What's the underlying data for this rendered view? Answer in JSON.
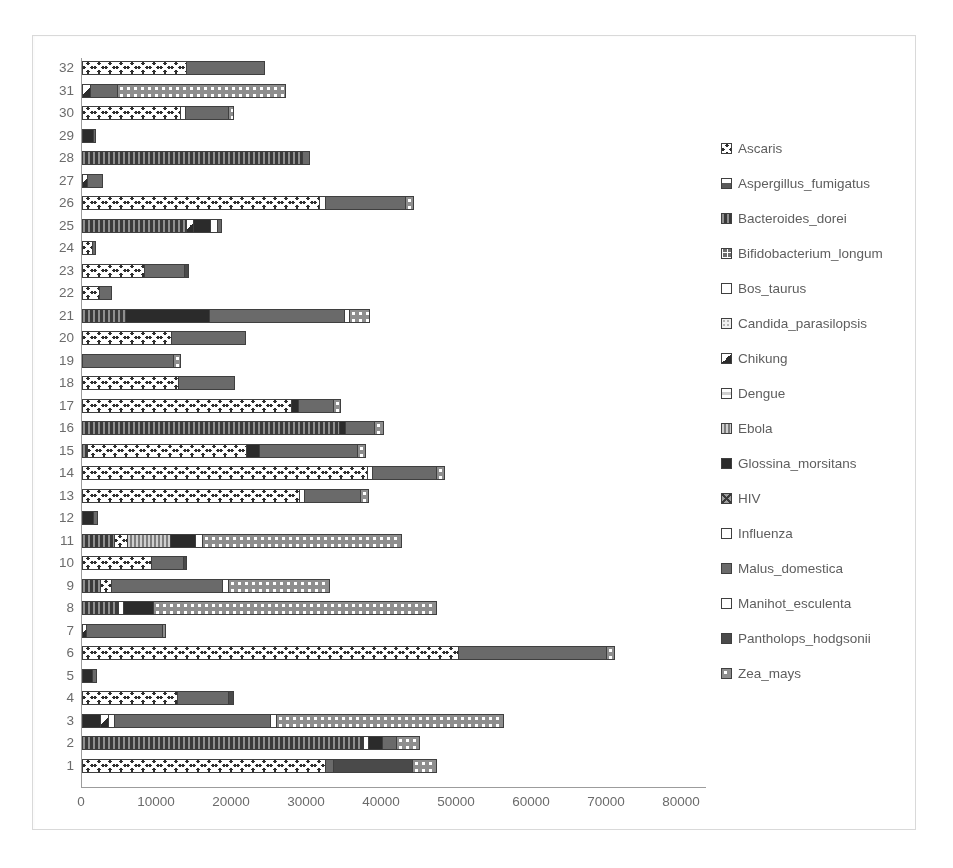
{
  "chart_data": {
    "type": "bar",
    "subtype": "stacked-horizontal-bar",
    "title": "",
    "xlabel": "",
    "ylabel": "",
    "xlim": [
      0,
      80000
    ],
    "ylim": [
      1,
      32
    ],
    "grid": false,
    "legend_position": "right",
    "x_ticks": [
      "0",
      "10000",
      "20000",
      "30000",
      "40000",
      "50000",
      "60000",
      "70000",
      "80000"
    ],
    "x_tick_values": [
      0,
      10000,
      20000,
      30000,
      40000,
      50000,
      60000,
      70000,
      80000
    ],
    "categories": [
      "1",
      "2",
      "3",
      "4",
      "5",
      "6",
      "7",
      "8",
      "9",
      "10",
      "11",
      "12",
      "13",
      "14",
      "15",
      "16",
      "17",
      "18",
      "19",
      "20",
      "21",
      "22",
      "23",
      "24",
      "25",
      "26",
      "27",
      "28",
      "29",
      "30",
      "31",
      "32"
    ],
    "series": [
      {
        "name": "Ascaris",
        "pattern": "dark-dense-grid",
        "color": "#4a4a4a"
      },
      {
        "name": "Aspergillus_fumigatus",
        "pattern": "split-box",
        "color": "#737373"
      },
      {
        "name": "Bacteroides_dorei",
        "pattern": "vertical-lines",
        "color": "#595959"
      },
      {
        "name": "Bifidobacterium_longum",
        "pattern": "cross-grid",
        "color": "#6e6e6e"
      },
      {
        "name": "Bos_taurus",
        "pattern": "solid-white",
        "color": "#ffffff"
      },
      {
        "name": "Candida_parasilopsis",
        "pattern": "light-dots",
        "color": "#f2f2f2"
      },
      {
        "name": "Chikung",
        "pattern": "half-filled",
        "color": "#404040"
      },
      {
        "name": "Dengue",
        "pattern": "small-square",
        "color": "#ffffff"
      },
      {
        "name": "Ebola",
        "pattern": "mid-gray-box",
        "color": "#8c8c8c"
      },
      {
        "name": "Glossina_morsitans",
        "pattern": "solid-dark",
        "color": "#333333"
      },
      {
        "name": "HIV",
        "pattern": "diagonal-cross",
        "color": "#9e9e9e"
      },
      {
        "name": "Influenza",
        "pattern": "empty-white",
        "color": "#ffffff"
      },
      {
        "name": "Malus_domestica",
        "pattern": "solid-gray",
        "color": "#5b5b5b"
      },
      {
        "name": "Manihot_esculenta",
        "pattern": "empty-white-2",
        "color": "#ffffff"
      },
      {
        "name": "Pantholops_hodgsonii",
        "pattern": "small-solid",
        "color": "#4f4f4f"
      },
      {
        "name": "Zea_mays",
        "pattern": "dotted-circles",
        "color": "#9a9a9a"
      }
    ],
    "stacks": [
      {
        "category": "1",
        "total": 47300,
        "segments": [
          {
            "series": "Ascaris",
            "value": 32400
          },
          {
            "series": "Malus_domestica",
            "value": 1100
          },
          {
            "series": "Pantholops_hodgsonii",
            "value": 10500
          },
          {
            "series": "Zea_mays",
            "value": 3300
          }
        ]
      },
      {
        "category": "2",
        "total": 45000,
        "segments": [
          {
            "series": "Bacteroides_dorei",
            "value": 37400
          },
          {
            "series": "Influenza",
            "value": 700
          },
          {
            "series": "Glossina_morsitans",
            "value": 1900
          },
          {
            "series": "Malus_domestica",
            "value": 1900
          },
          {
            "series": "Zea_mays",
            "value": 3100
          }
        ]
      },
      {
        "category": "3",
        "total": 56300,
        "segments": [
          {
            "series": "Glossina_morsitans",
            "value": 2400
          },
          {
            "series": "Chikung",
            "value": 1100
          },
          {
            "series": "Bos_taurus",
            "value": 700
          },
          {
            "series": "Malus_domestica",
            "value": 20900
          },
          {
            "series": "Influenza",
            "value": 800
          },
          {
            "series": "Zea_mays",
            "value": 30400
          }
        ]
      },
      {
        "category": "4",
        "total": 20200,
        "segments": [
          {
            "series": "Ascaris",
            "value": 12700
          },
          {
            "series": "Malus_domestica",
            "value": 6800
          },
          {
            "series": "Pantholops_hodgsonii",
            "value": 700
          }
        ]
      },
      {
        "category": "5",
        "total": 2000,
        "segments": [
          {
            "series": "Glossina_morsitans",
            "value": 1300
          },
          {
            "series": "Malus_domestica",
            "value": 700
          }
        ]
      },
      {
        "category": "6",
        "total": 71000,
        "segments": [
          {
            "series": "Ascaris",
            "value": 50100
          },
          {
            "series": "Malus_domestica",
            "value": 19700
          },
          {
            "series": "Zea_mays",
            "value": 1200
          }
        ]
      },
      {
        "category": "7",
        "total": 11200,
        "segments": [
          {
            "series": "Chikung",
            "value": 500
          },
          {
            "series": "Malus_domestica",
            "value": 10100
          },
          {
            "series": "Zea_mays",
            "value": 600
          }
        ]
      },
      {
        "category": "8",
        "total": 47300,
        "segments": [
          {
            "series": "Bacteroides_dorei",
            "value": 4800
          },
          {
            "series": "Bos_taurus",
            "value": 700
          },
          {
            "series": "Glossina_morsitans",
            "value": 3900
          },
          {
            "series": "Zea_mays",
            "value": 37900
          }
        ]
      },
      {
        "category": "9",
        "total": 33000,
        "segments": [
          {
            "series": "Bacteroides_dorei",
            "value": 2400
          },
          {
            "series": "Ascaris",
            "value": 1500
          },
          {
            "series": "Malus_domestica",
            "value": 14700
          },
          {
            "series": "Influenza",
            "value": 800
          },
          {
            "series": "Zea_mays",
            "value": 13600
          }
        ]
      },
      {
        "category": "10",
        "total": 14000,
        "segments": [
          {
            "series": "Ascaris",
            "value": 9200
          },
          {
            "series": "Malus_domestica",
            "value": 4300
          },
          {
            "series": "Pantholops_hodgsonii",
            "value": 500
          }
        ]
      },
      {
        "category": "11",
        "total": 42700,
        "segments": [
          {
            "series": "Bacteroides_dorei",
            "value": 4300
          },
          {
            "series": "Ascaris",
            "value": 1700
          },
          {
            "series": "Ebola",
            "value": 5700
          },
          {
            "series": "Glossina_morsitans",
            "value": 3400
          },
          {
            "series": "Influenza",
            "value": 900
          },
          {
            "series": "Zea_mays",
            "value": 26700
          }
        ]
      },
      {
        "category": "12",
        "total": 2100,
        "segments": [
          {
            "series": "Glossina_morsitans",
            "value": 1400
          },
          {
            "series": "Malus_domestica",
            "value": 700
          }
        ]
      },
      {
        "category": "13",
        "total": 38300,
        "segments": [
          {
            "series": "Ascaris",
            "value": 28900
          },
          {
            "series": "Influenza",
            "value": 700
          },
          {
            "series": "Malus_domestica",
            "value": 7500
          },
          {
            "series": "Zea_mays",
            "value": 1200
          }
        ]
      },
      {
        "category": "14",
        "total": 48400,
        "segments": [
          {
            "series": "Ascaris",
            "value": 38000
          },
          {
            "series": "Influenza",
            "value": 700
          },
          {
            "series": "Malus_domestica",
            "value": 8500
          },
          {
            "series": "Zea_mays",
            "value": 1200
          }
        ]
      },
      {
        "category": "15",
        "total": 37900,
        "segments": [
          {
            "series": "Bacteroides_dorei",
            "value": 700
          },
          {
            "series": "Ascaris",
            "value": 21200
          },
          {
            "series": "Glossina_morsitans",
            "value": 1700
          },
          {
            "series": "Malus_domestica",
            "value": 13100
          },
          {
            "series": "Zea_mays",
            "value": 1200
          }
        ]
      },
      {
        "category": "16",
        "total": 40300,
        "segments": [
          {
            "series": "Bacteroides_dorei",
            "value": 34200
          },
          {
            "series": "Glossina_morsitans",
            "value": 900
          },
          {
            "series": "Malus_domestica",
            "value": 3800
          },
          {
            "series": "Zea_mays",
            "value": 1400
          }
        ]
      },
      {
        "category": "17",
        "total": 34500,
        "segments": [
          {
            "series": "Ascaris",
            "value": 27900
          },
          {
            "series": "Glossina_morsitans",
            "value": 900
          },
          {
            "series": "Malus_domestica",
            "value": 4700
          },
          {
            "series": "Zea_mays",
            "value": 1000
          }
        ]
      },
      {
        "category": "18",
        "total": 20400,
        "segments": [
          {
            "series": "Ascaris",
            "value": 12800
          },
          {
            "series": "Malus_domestica",
            "value": 7600
          }
        ]
      },
      {
        "category": "19",
        "total": 13200,
        "segments": [
          {
            "series": "Malus_domestica",
            "value": 12100
          },
          {
            "series": "Zea_mays",
            "value": 1100
          }
        ]
      },
      {
        "category": "20",
        "total": 21800,
        "segments": [
          {
            "series": "Ascaris",
            "value": 11900
          },
          {
            "series": "Malus_domestica",
            "value": 9900
          }
        ]
      },
      {
        "category": "21",
        "total": 38400,
        "segments": [
          {
            "series": "Bacteroides_dorei",
            "value": 5700
          },
          {
            "series": "Glossina_morsitans",
            "value": 11200
          },
          {
            "series": "Malus_domestica",
            "value": 18000
          },
          {
            "series": "Influenza",
            "value": 700
          },
          {
            "series": "Zea_mays",
            "value": 2800
          }
        ]
      },
      {
        "category": "22",
        "total": 4000,
        "segments": [
          {
            "series": "Ascaris",
            "value": 2200
          },
          {
            "series": "Malus_domestica",
            "value": 1800
          }
        ]
      },
      {
        "category": "23",
        "total": 14300,
        "segments": [
          {
            "series": "Ascaris",
            "value": 8200
          },
          {
            "series": "Malus_domestica",
            "value": 5400
          },
          {
            "series": "Pantholops_hodgsonii",
            "value": 700
          }
        ]
      },
      {
        "category": "24",
        "total": 1800,
        "segments": [
          {
            "series": "Ascaris",
            "value": 1300
          },
          {
            "series": "Malus_domestica",
            "value": 500
          }
        ]
      },
      {
        "category": "25",
        "total": 18700,
        "segments": [
          {
            "series": "Bacteroides_dorei",
            "value": 13900
          },
          {
            "series": "Chikung",
            "value": 900
          },
          {
            "series": "Glossina_morsitans",
            "value": 2300
          },
          {
            "series": "Influenza",
            "value": 900
          },
          {
            "series": "Malus_domestica",
            "value": 700
          }
        ]
      },
      {
        "category": "26",
        "total": 44300,
        "segments": [
          {
            "series": "Ascaris",
            "value": 31600
          },
          {
            "series": "Influenza",
            "value": 800
          },
          {
            "series": "Malus_domestica",
            "value": 10700
          },
          {
            "series": "Zea_mays",
            "value": 1200
          }
        ]
      },
      {
        "category": "27",
        "total": 2800,
        "segments": [
          {
            "series": "Chikung",
            "value": 700
          },
          {
            "series": "Malus_domestica",
            "value": 2100
          }
        ]
      },
      {
        "category": "28",
        "total": 30400,
        "segments": [
          {
            "series": "Bacteroides_dorei",
            "value": 29300
          },
          {
            "series": "Malus_domestica",
            "value": 1100
          }
        ]
      },
      {
        "category": "29",
        "total": 1900,
        "segments": [
          {
            "series": "Glossina_morsitans",
            "value": 1400
          },
          {
            "series": "Malus_domestica",
            "value": 500
          }
        ]
      },
      {
        "category": "30",
        "total": 20200,
        "segments": [
          {
            "series": "Ascaris",
            "value": 13000
          },
          {
            "series": "Influenza",
            "value": 700
          },
          {
            "series": "Malus_domestica",
            "value": 5800
          },
          {
            "series": "Zea_mays",
            "value": 700
          }
        ]
      },
      {
        "category": "31",
        "total": 27200,
        "segments": [
          {
            "series": "Chikung",
            "value": 1100
          },
          {
            "series": "Malus_domestica",
            "value": 3600
          },
          {
            "series": "Zea_mays",
            "value": 22500
          }
        ]
      },
      {
        "category": "32",
        "total": 24400,
        "segments": [
          {
            "series": "Ascaris",
            "value": 13900
          },
          {
            "series": "Malus_domestica",
            "value": 10500
          }
        ]
      }
    ]
  },
  "legend": {
    "items": [
      {
        "label": "Ascaris"
      },
      {
        "label": "Aspergillus_fumigatus"
      },
      {
        "label": "Bacteroides_dorei"
      },
      {
        "label": "Bifidobacterium_longum"
      },
      {
        "label": "Bos_taurus"
      },
      {
        "label": "Candida_parasilopsis"
      },
      {
        "label": "Chikung"
      },
      {
        "label": "Dengue"
      },
      {
        "label": "Ebola"
      },
      {
        "label": "Glossina_morsitans"
      },
      {
        "label": "HIV"
      },
      {
        "label": "Influenza"
      },
      {
        "label": "Malus_domestica"
      },
      {
        "label": "Manihot_esculenta"
      },
      {
        "label": "Pantholops_hodgsonii"
      },
      {
        "label": "Zea_mays"
      }
    ]
  }
}
